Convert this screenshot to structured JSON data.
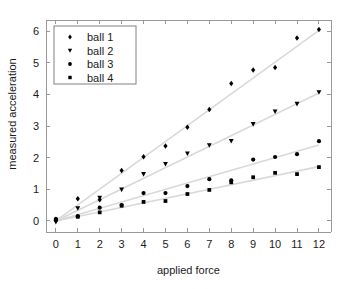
{
  "chart_data": {
    "type": "scatter",
    "title": "",
    "xlabel": "applied force",
    "ylabel": "measured acceleration",
    "xlim": [
      -0.45,
      12.55
    ],
    "ylim": [
      -0.35,
      6.35
    ],
    "xticks": [
      0,
      1,
      2,
      3,
      4,
      5,
      6,
      7,
      8,
      9,
      10,
      11,
      12
    ],
    "yticks": [
      0,
      1,
      2,
      3,
      4,
      5,
      6
    ],
    "xticklabels": [
      "0",
      "1",
      "2",
      "3",
      "4",
      "5",
      "6",
      "7",
      "8",
      "9",
      "10",
      "11",
      "12"
    ],
    "yticklabels": [
      "0",
      "1",
      "2",
      "3",
      "4",
      "5",
      "6"
    ],
    "grid": false,
    "legend_position": "upper left",
    "x": [
      0,
      1,
      2,
      3,
      4,
      5,
      6,
      7,
      8,
      9,
      10,
      11,
      12
    ],
    "series": [
      {
        "name": "ball 1",
        "marker": "diamond",
        "color": "#000000",
        "fit_slope": 0.502,
        "fit_intercept": 0.0,
        "values": [
          0.05,
          0.7,
          0.67,
          1.59,
          2.03,
          2.37,
          2.96,
          3.52,
          4.34,
          4.77,
          4.85,
          5.78,
          6.05
        ]
      },
      {
        "name": "ball 2",
        "marker": "triangle-down",
        "color": "#000000",
        "fit_slope": 0.337,
        "fit_intercept": 0.0,
        "values": [
          -0.03,
          0.4,
          0.73,
          0.99,
          1.48,
          1.8,
          2.13,
          2.39,
          2.53,
          3.06,
          3.46,
          3.7,
          4.07
        ]
      },
      {
        "name": "ball 3",
        "marker": "circle",
        "color": "#000000",
        "fit_slope": 0.2,
        "fit_intercept": 0.0,
        "values": [
          0.06,
          0.15,
          0.42,
          0.5,
          0.88,
          0.88,
          1.1,
          1.32,
          1.28,
          1.94,
          2.02,
          2.11,
          2.52
        ]
      },
      {
        "name": "ball 4",
        "marker": "square",
        "color": "#000000",
        "fit_slope": 0.143,
        "fit_intercept": 0.0,
        "values": [
          0.04,
          0.13,
          0.27,
          0.48,
          0.6,
          0.63,
          0.85,
          0.98,
          1.22,
          1.38,
          1.52,
          1.48,
          1.7
        ]
      }
    ],
    "axis_color": "#999999",
    "fitline_color": "#d9d9d9",
    "background": "#ffffff"
  },
  "legend": {
    "entries": [
      {
        "label": "ball 1"
      },
      {
        "label": "ball 2"
      },
      {
        "label": "ball 3"
      },
      {
        "label": "ball 4"
      }
    ]
  }
}
